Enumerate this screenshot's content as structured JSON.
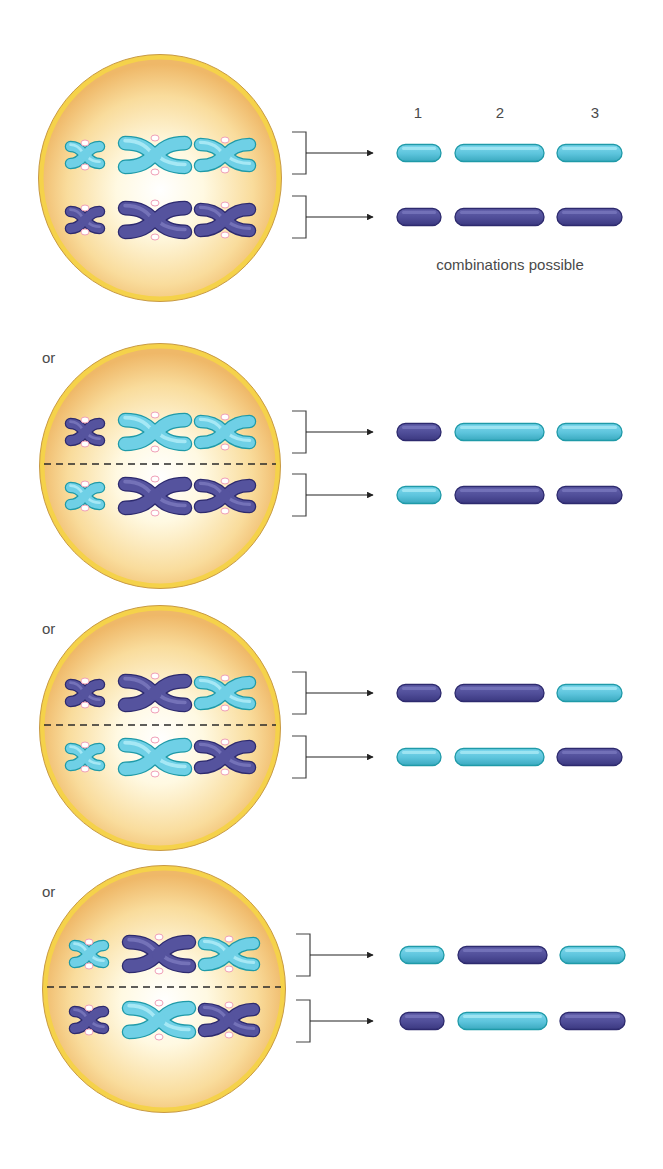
{
  "header": {
    "column_labels": [
      "1",
      "2",
      "3"
    ],
    "caption": "combinations possible"
  },
  "separator_label": "or",
  "colors": {
    "cell_fill_center": "#fffdf2",
    "cell_fill_edge": "#f2c070",
    "cell_border": "#f5d24a",
    "cell_outline": "#c89a45",
    "light": "#6ecfe6",
    "light_edge": "#1f9aa8",
    "dark": "#4f4f9c",
    "dark_edge": "#2d2a6e",
    "centromere": "#f0a0b8",
    "line": "#333333"
  },
  "arrangements": [
    {
      "id": 1,
      "show_or": false,
      "show_divider": false,
      "metaphase_top": [
        "light",
        "light",
        "light"
      ],
      "metaphase_bottom": [
        "dark",
        "dark",
        "dark"
      ],
      "gamete_top": [
        "light",
        "light",
        "light"
      ],
      "gamete_bottom": [
        "dark",
        "dark",
        "dark"
      ]
    },
    {
      "id": 2,
      "show_or": true,
      "show_divider": true,
      "metaphase_top": [
        "dark",
        "light",
        "light"
      ],
      "metaphase_bottom": [
        "light",
        "dark",
        "dark"
      ],
      "gamete_top": [
        "dark",
        "light",
        "light"
      ],
      "gamete_bottom": [
        "light",
        "dark",
        "dark"
      ]
    },
    {
      "id": 3,
      "show_or": true,
      "show_divider": true,
      "metaphase_top": [
        "dark",
        "dark",
        "light"
      ],
      "metaphase_bottom": [
        "light",
        "light",
        "dark"
      ],
      "gamete_top": [
        "dark",
        "dark",
        "light"
      ],
      "gamete_bottom": [
        "light",
        "light",
        "dark"
      ]
    },
    {
      "id": 4,
      "show_or": true,
      "show_divider": true,
      "metaphase_top": [
        "light",
        "dark",
        "light"
      ],
      "metaphase_bottom": [
        "dark",
        "light",
        "dark"
      ],
      "gamete_top": [
        "light",
        "dark",
        "light"
      ],
      "gamete_bottom": [
        "dark",
        "light",
        "dark"
      ]
    }
  ]
}
